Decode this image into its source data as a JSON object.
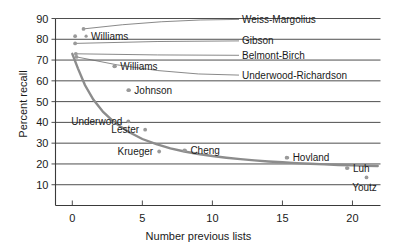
{
  "chart_data": {
    "type": "scatter",
    "title": "",
    "xlabel": "Number previous lists",
    "ylabel": "Percent recall",
    "xlim": [
      -1.2,
      22.0
    ],
    "ylim": [
      0,
      90
    ],
    "xticks": [
      0,
      5,
      10,
      15,
      20
    ],
    "yticks": [
      10,
      20,
      30,
      40,
      50,
      60,
      70,
      80,
      90
    ],
    "grid": true,
    "legend": "none",
    "points": [
      {
        "label": "Williams",
        "x": 0.2,
        "y": 81.5,
        "label_side": "right-gap"
      },
      {
        "label": "Weiss-Margolius",
        "x": 0.8,
        "y": 85.0,
        "label_side": "leader-right"
      },
      {
        "label": "Gibson",
        "x": 0.2,
        "y": 78.0,
        "label_side": "leader-right"
      },
      {
        "label": "Belmont-Birch",
        "x": 0.25,
        "y": 73.0,
        "label_side": "leader-right"
      },
      {
        "label": "Underwood-Richardson",
        "x": 0.3,
        "y": 71.5,
        "label_side": "leader-right"
      },
      {
        "label": "Williams",
        "x": 3.0,
        "y": 67.0,
        "label_side": "right"
      },
      {
        "label": "Johnson",
        "x": 4.0,
        "y": 55.5,
        "label_side": "right"
      },
      {
        "label": "Underwood",
        "x": 4.0,
        "y": 40.5,
        "label_side": "left"
      },
      {
        "label": "Lester",
        "x": 5.2,
        "y": 36.5,
        "label_side": "left"
      },
      {
        "label": "Krueger",
        "x": 6.2,
        "y": 26.0,
        "label_side": "left"
      },
      {
        "label": "Cheng",
        "x": 8.0,
        "y": 26.5,
        "label_side": "right"
      },
      {
        "label": "Hovland",
        "x": 15.3,
        "y": 23.0,
        "label_side": "right"
      },
      {
        "label": "Luh",
        "x": 19.6,
        "y": 18.0,
        "label_side": "right"
      },
      {
        "label": "Youtz",
        "x": 21.0,
        "y": 13.5,
        "label_side": "below"
      }
    ],
    "fit_curve": {
      "name": "decay-fit",
      "x": [
        0.0,
        0.4,
        0.9,
        1.5,
        2.2,
        3.0,
        4.0,
        5.0,
        6.0,
        7.0,
        8.0,
        9.0,
        10.0,
        11.0,
        12.0,
        13.0,
        14.0,
        15.0,
        16.0,
        17.0,
        18.0,
        19.0,
        20.0,
        21.0,
        21.8
      ],
      "y": [
        73.0,
        66.0,
        58.0,
        51.0,
        45.0,
        40.0,
        35.5,
        32.0,
        29.5,
        27.5,
        26.0,
        24.8,
        23.8,
        23.0,
        22.3,
        21.7,
        21.2,
        20.8,
        20.4,
        20.1,
        19.8,
        19.5,
        19.3,
        19.1,
        19.0
      ]
    }
  },
  "colors": {
    "axis": "#3a3a3a",
    "gridline": "#3a3a3a",
    "curve": "#8c8c8c",
    "point": "#9a9a9a",
    "leader": "#6b6b6b",
    "text": "#1a1a1a",
    "background": "#ffffff"
  }
}
